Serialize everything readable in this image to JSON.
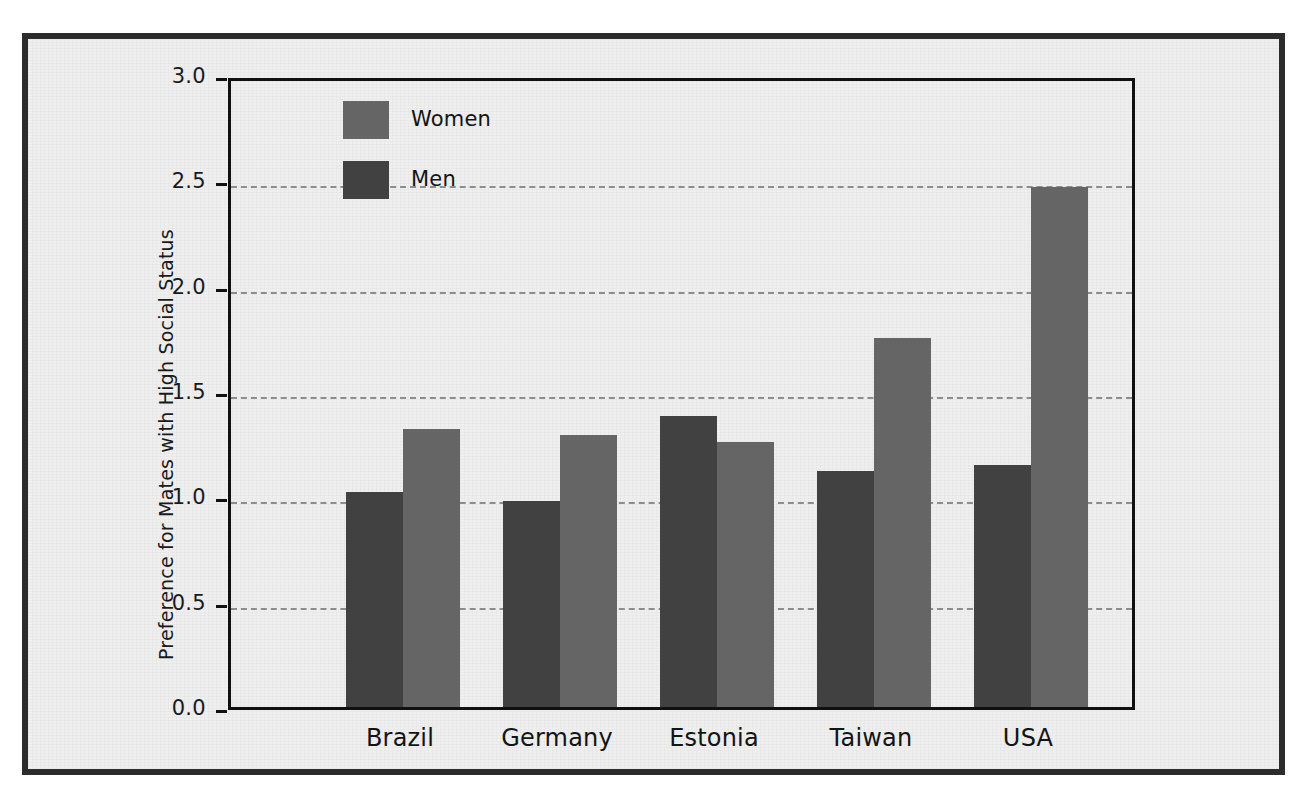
{
  "chart_data": {
    "type": "bar",
    "title": "",
    "subtitle": "",
    "xlabel": "",
    "ylabel": "Preference for Mates with High Social Status",
    "categories": [
      "Brazil",
      "Germany",
      "Estonia",
      "Taiwan",
      "USA"
    ],
    "series": [
      {
        "name": "Men",
        "color": "#414141",
        "values": [
          1.02,
          0.98,
          1.38,
          1.12,
          1.15
        ]
      },
      {
        "name": "Women",
        "color": "#656565",
        "values": [
          1.32,
          1.29,
          1.26,
          1.75,
          2.47
        ]
      }
    ],
    "series_order_in_group": [
      "Men",
      "Women"
    ],
    "ylim": [
      0.0,
      3.0
    ],
    "ytick_labels": [
      "0.0",
      "0.5",
      "1.0",
      "1.5",
      "2.0",
      "2.5",
      "3.0"
    ],
    "ytick_values": [
      0.0,
      0.5,
      1.0,
      1.5,
      2.0,
      2.5,
      3.0
    ],
    "grid": "horizontal-dashed",
    "legend_position": "top-left-inside",
    "legend_entries": [
      "Women",
      "Men"
    ]
  },
  "legend": {
    "women_label": "Women",
    "men_label": "Men"
  },
  "axis": {
    "y_title": "Preference for Mates with High Social Status"
  },
  "colors": {
    "men_bar": "#414141",
    "women_bar": "#656565",
    "axis_line": "#111111",
    "gridline": "#8d8d8d",
    "frame": "#2c2c2c",
    "background": "#eeefee"
  }
}
